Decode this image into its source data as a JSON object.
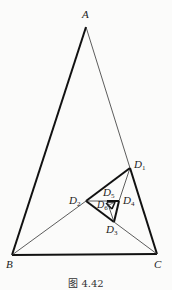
{
  "figure": {
    "caption": "图 4.42",
    "points": {
      "A": {
        "label": "A",
        "x": 86,
        "y": 27
      },
      "B": {
        "label": "B",
        "x": 12,
        "y": 255
      },
      "C": {
        "label": "C",
        "x": 157,
        "y": 254
      },
      "D1": {
        "label": "D",
        "sub": "1",
        "x": 130,
        "y": 168
      },
      "D2": {
        "label": "D",
        "sub": "2",
        "x": 86,
        "y": 201
      },
      "D3": {
        "label": "D",
        "sub": "3",
        "x": 114,
        "y": 222
      },
      "D4": {
        "label": "D",
        "sub": "4",
        "x": 119,
        "y": 201
      },
      "D5": {
        "label": "D",
        "sub": "5",
        "x": 107,
        "y": 210
      },
      "D6": {
        "label": "D",
        "sub": "6",
        "x": 106,
        "y": 203
      }
    },
    "colors": {
      "line": "#1a1a1a",
      "background": "#fbfbfa"
    }
  }
}
